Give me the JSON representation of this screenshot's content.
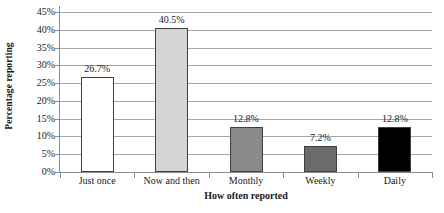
{
  "chart_data": {
    "type": "bar",
    "title": "",
    "xlabel": "How often reported",
    "ylabel": "Percentage reporting",
    "categories": [
      "Just once",
      "Now and then",
      "Monthly",
      "Weekly",
      "Daily"
    ],
    "values": [
      26.7,
      40.5,
      12.8,
      7.2,
      12.8
    ],
    "data_labels": [
      "26.7%",
      "40.5%",
      "12.8%",
      "7.2%",
      "12.8%"
    ],
    "bar_colors": [
      "#ffffff",
      "#d4d4d4",
      "#8a8a8a",
      "#6b6b6b",
      "#000000"
    ],
    "bar_border_color": "#404040",
    "ylim": [
      0,
      45
    ],
    "ytick_values": [
      0,
      5,
      10,
      15,
      20,
      25,
      30,
      35,
      40,
      45
    ],
    "ytick_labels": [
      "0%",
      "5%",
      "10%",
      "15%",
      "20%",
      "25%",
      "30%",
      "35%",
      "40%",
      "45%"
    ],
    "grid": true,
    "grid_color": "#a6a6a6",
    "legend": "none",
    "axis_color": "#8c8c8c",
    "background": "#ffffff"
  }
}
